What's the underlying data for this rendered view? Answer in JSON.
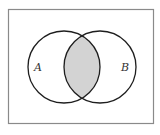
{
  "diagram": {
    "type": "venn",
    "universe": {
      "x": 8,
      "y": 9,
      "width": 146,
      "height": 115,
      "stroke": "#8a8a8a"
    },
    "sets": [
      {
        "label": "A",
        "cx": 64,
        "cy": 67,
        "r": 36,
        "label_x": 38,
        "label_y": 71
      },
      {
        "label": "B",
        "cx": 100,
        "cy": 67,
        "r": 36,
        "label_x": 125,
        "label_y": 71
      }
    ],
    "shaded_region": "A ∩ B",
    "colors": {
      "shade": "#d3d3d3",
      "circle_stroke": "#1e1e1e",
      "background": "#ffffff"
    }
  }
}
